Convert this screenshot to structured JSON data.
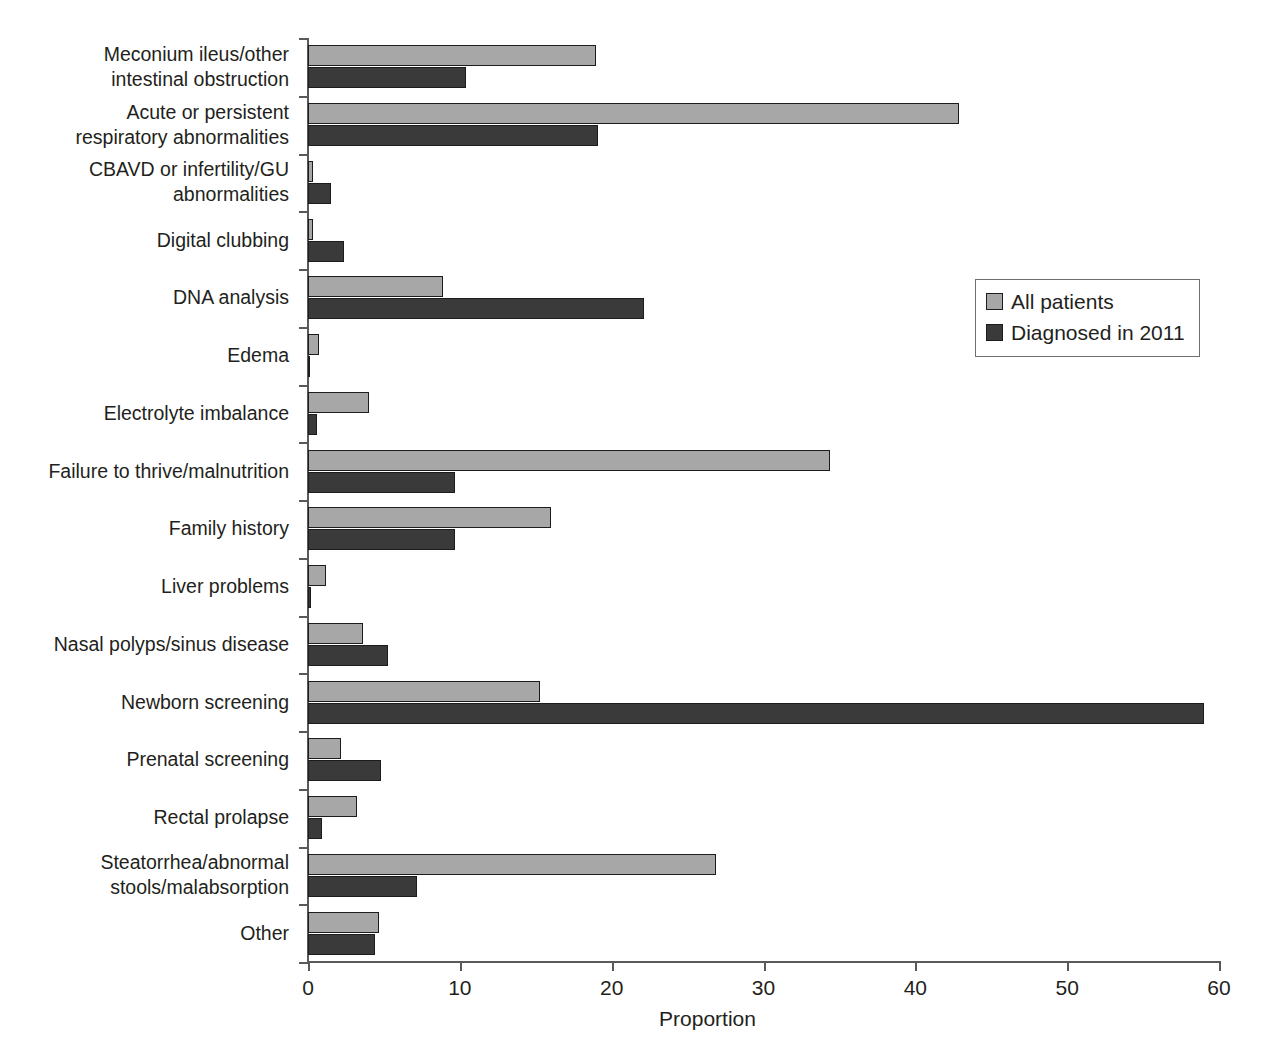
{
  "chart_data": {
    "type": "bar",
    "orientation": "horizontal",
    "title": "",
    "xlabel": "Proportion",
    "ylabel": "",
    "xlim": [
      0,
      60
    ],
    "xticks": [
      0,
      10,
      20,
      30,
      40,
      50,
      60
    ],
    "grid": false,
    "legend_position": "right",
    "colors": {
      "all_patients": "#a7a7a7",
      "diagnosed_2011": "#3a3a3a",
      "axis": "#58595b",
      "text": "#231f20",
      "bar_outline": "#1c1c1c"
    },
    "categories": [
      "Meconium ileus/other\nintestinal obstruction",
      "Acute or persistent\nrespiratory abnormalities",
      "CBAVD or infertility/GU\nabnormalities",
      "Digital clubbing",
      "DNA analysis",
      "Edema",
      "Electrolyte imbalance",
      "Failure to thrive/malnutrition",
      "Family history",
      "Liver problems",
      "Nasal polyps/sinus disease",
      "Newborn screening",
      "Prenatal screening",
      "Rectal prolapse",
      "Steatorrhea/abnormal\nstools/malabsorption",
      "Other"
    ],
    "series": [
      {
        "name": "All patients",
        "values": [
          19.0,
          42.9,
          0.3,
          0.3,
          8.9,
          0.7,
          4.0,
          34.4,
          16.0,
          1.2,
          3.6,
          15.3,
          2.2,
          3.2,
          26.9,
          4.7
        ]
      },
      {
        "name": "Diagnosed in 2011",
        "values": [
          10.4,
          19.1,
          1.5,
          2.4,
          22.1,
          0.1,
          0.6,
          9.7,
          9.7,
          0.2,
          5.3,
          59.0,
          4.8,
          0.9,
          7.2,
          4.4
        ]
      }
    ]
  },
  "legend": {
    "items": [
      {
        "label": "All patients",
        "color": "#a7a7a7"
      },
      {
        "label": "Diagnosed in 2011",
        "color": "#3a3a3a"
      }
    ]
  },
  "axis": {
    "x_title": "Proportion",
    "x_tick_labels": [
      "0",
      "10",
      "20",
      "30",
      "40",
      "50",
      "60"
    ]
  }
}
